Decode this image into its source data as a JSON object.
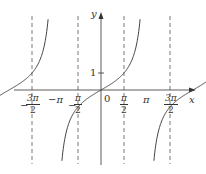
{
  "chart_data": {
    "type": "line",
    "title": "",
    "function": "y = tan x",
    "xlabel": "x",
    "ylabel": "y",
    "x_ticks": [
      {
        "value": -4.712,
        "label_num": "3π",
        "label_den": "2",
        "sign": "−"
      },
      {
        "value": -3.1416,
        "label": "−π"
      },
      {
        "value": -1.5708,
        "label_num": "π",
        "label_den": "2",
        "sign": "−"
      },
      {
        "value": 0,
        "label": "0"
      },
      {
        "value": 1.5708,
        "label_num": "π",
        "label_den": "2",
        "sign": ""
      },
      {
        "value": 3.1416,
        "label": "π"
      },
      {
        "value": 4.712,
        "label_num": "3π",
        "label_den": "2",
        "sign": ""
      }
    ],
    "y_ticks": [
      {
        "value": 1,
        "label": "1"
      }
    ],
    "asymptotes_x": [
      -4.712,
      -1.5708,
      1.5708,
      4.712
    ],
    "series": [
      {
        "name": "tan x branch",
        "domain": [
          -4.712,
          -1.5708
        ]
      },
      {
        "name": "tan x branch",
        "domain": [
          -1.5708,
          1.5708
        ]
      },
      {
        "name": "tan x branch",
        "domain": [
          1.5708,
          4.712
        ]
      }
    ],
    "grid": false,
    "legend": "none"
  },
  "labels": {
    "x_axis": "x",
    "y_axis": "y",
    "origin": "0",
    "y_one": "1",
    "neg_pi": "−π",
    "pi": "π",
    "neg_3pi_2_sign": "−",
    "neg_3pi_2_num": "3π",
    "neg_3pi_2_den": "2",
    "neg_pi_2_sign": "−",
    "neg_pi_2_num": "π",
    "neg_pi_2_den": "2",
    "pi_2_num": "π",
    "pi_2_den": "2",
    "three_pi_2_num": "3π",
    "three_pi_2_den": "2"
  }
}
